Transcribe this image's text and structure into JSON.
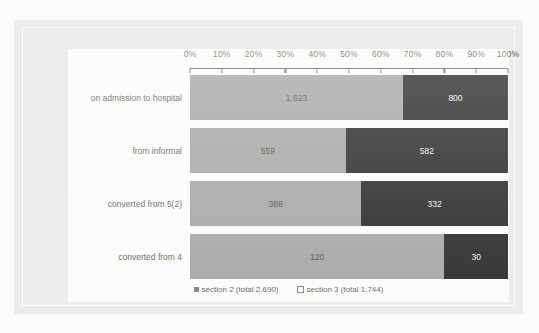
{
  "page": {
    "top_cut_caption": ""
  },
  "chart_data": {
    "type": "bar",
    "orientation": "horizontal",
    "stacked": true,
    "normalized": true,
    "title": "",
    "xlabel": "",
    "ylabel": "",
    "xlim": [
      0,
      100
    ],
    "grid": false,
    "legend_position": "bottom-center",
    "axis_tick_labels": [
      "0%",
      "10%",
      "20%",
      "30%",
      "40%",
      "50%",
      "60%",
      "70%",
      "80%",
      "90%",
      "100%"
    ],
    "axis_tick_values": [
      0,
      10,
      20,
      30,
      40,
      50,
      60,
      70,
      80,
      90,
      100
    ],
    "categories": [
      "on admission to hospital",
      "from informal",
      "converted from 5(2)",
      "converted from 4"
    ],
    "series": [
      {
        "name": "section 2 (total 2,690)",
        "color": "#9a9a98",
        "values": [
          1623,
          559,
          388,
          120
        ],
        "labels": [
          "1,623",
          "559",
          "388",
          "120"
        ]
      },
      {
        "name": "section 3 (total 1,744)",
        "color": "#0a0a0a",
        "values": [
          800,
          582,
          332,
          30
        ],
        "labels": [
          "800",
          "582",
          "332",
          "30"
        ]
      }
    ],
    "legend": [
      {
        "label": "section 2 (total 2,690)",
        "marker": "filled"
      },
      {
        "label": "section 3 (total 1,744)",
        "marker": "hollow"
      }
    ]
  }
}
